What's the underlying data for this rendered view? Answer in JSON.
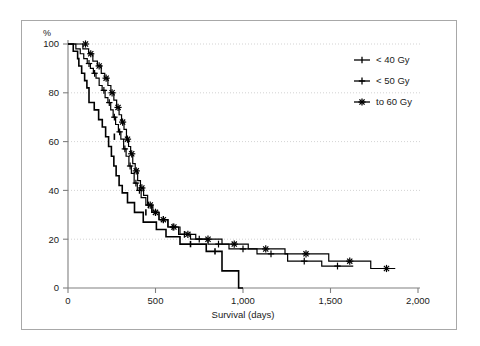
{
  "figure": {
    "background": "#ffffff",
    "frame_color": "#a8a8a8",
    "axis_color": "#808080",
    "grid_color": "#c8c8c8",
    "curve_color": "#000000"
  },
  "chart_data": {
    "type": "line",
    "subtype": "kaplan-meier-step",
    "title": "",
    "xlabel": "Survival (days)",
    "ylabel": "%",
    "xlim": [
      0,
      2000
    ],
    "ylim": [
      0,
      100
    ],
    "xticks": [
      0,
      500,
      1000,
      1500,
      2000
    ],
    "xticklabels": [
      "0",
      "500",
      "1,000",
      "1,500",
      "2,000"
    ],
    "yticks": [
      0,
      20,
      40,
      60,
      80,
      100
    ],
    "yticklabels": [
      "0",
      "20",
      "40",
      "60",
      "80",
      "100"
    ],
    "grid": "horizontal-dotted",
    "legend_position": "upper-right",
    "series": [
      {
        "name": "< 40 Gy",
        "marker": "tick",
        "linewidth": 1.6,
        "points": [
          [
            0,
            100
          ],
          [
            30,
            100
          ],
          [
            30,
            97
          ],
          [
            55,
            97
          ],
          [
            55,
            94
          ],
          [
            62,
            94
          ],
          [
            62,
            91
          ],
          [
            78,
            91
          ],
          [
            78,
            88
          ],
          [
            95,
            88
          ],
          [
            95,
            85
          ],
          [
            108,
            85
          ],
          [
            108,
            82
          ],
          [
            120,
            82
          ],
          [
            120,
            76
          ],
          [
            150,
            76
          ],
          [
            150,
            73
          ],
          [
            175,
            73
          ],
          [
            175,
            69
          ],
          [
            196,
            69
          ],
          [
            196,
            66
          ],
          [
            215,
            66
          ],
          [
            215,
            62
          ],
          [
            232,
            62
          ],
          [
            232,
            58
          ],
          [
            248,
            58
          ],
          [
            248,
            54
          ],
          [
            262,
            54
          ],
          [
            262,
            50
          ],
          [
            275,
            50
          ],
          [
            275,
            46
          ],
          [
            292,
            46
          ],
          [
            292,
            42
          ],
          [
            310,
            42
          ],
          [
            310,
            39
          ],
          [
            340,
            39
          ],
          [
            340,
            35
          ],
          [
            380,
            35
          ],
          [
            380,
            31
          ],
          [
            430,
            31
          ],
          [
            430,
            27
          ],
          [
            505,
            27
          ],
          [
            505,
            24
          ],
          [
            560,
            24
          ],
          [
            560,
            21
          ],
          [
            640,
            21
          ],
          [
            640,
            18
          ],
          [
            790,
            18
          ],
          [
            790,
            15
          ],
          [
            880,
            15
          ],
          [
            880,
            7
          ],
          [
            975,
            7
          ],
          [
            975,
            0
          ],
          [
            1000,
            0
          ]
        ],
        "censored": [
          [
            265,
            62
          ],
          [
            445,
            31
          ],
          [
            700,
            18
          ],
          [
            840,
            15
          ]
        ]
      },
      {
        "name": "< 50 Gy",
        "marker": "plus",
        "linewidth": 1.2,
        "points": [
          [
            0,
            100
          ],
          [
            45,
            100
          ],
          [
            45,
            98
          ],
          [
            70,
            98
          ],
          [
            70,
            96
          ],
          [
            90,
            96
          ],
          [
            90,
            94
          ],
          [
            110,
            94
          ],
          [
            110,
            92
          ],
          [
            128,
            92
          ],
          [
            128,
            90
          ],
          [
            145,
            90
          ],
          [
            145,
            88
          ],
          [
            160,
            88
          ],
          [
            160,
            86
          ],
          [
            178,
            86
          ],
          [
            178,
            83
          ],
          [
            195,
            83
          ],
          [
            195,
            81
          ],
          [
            212,
            81
          ],
          [
            212,
            78
          ],
          [
            228,
            78
          ],
          [
            228,
            76
          ],
          [
            244,
            76
          ],
          [
            244,
            73
          ],
          [
            258,
            73
          ],
          [
            258,
            70
          ],
          [
            272,
            70
          ],
          [
            272,
            67
          ],
          [
            288,
            67
          ],
          [
            288,
            64
          ],
          [
            302,
            64
          ],
          [
            302,
            61
          ],
          [
            318,
            61
          ],
          [
            318,
            57
          ],
          [
            332,
            57
          ],
          [
            332,
            54
          ],
          [
            348,
            54
          ],
          [
            348,
            50
          ],
          [
            362,
            50
          ],
          [
            362,
            47
          ],
          [
            378,
            47
          ],
          [
            378,
            43
          ],
          [
            396,
            43
          ],
          [
            396,
            40
          ],
          [
            418,
            40
          ],
          [
            418,
            37
          ],
          [
            445,
            37
          ],
          [
            445,
            34
          ],
          [
            478,
            34
          ],
          [
            478,
            31
          ],
          [
            520,
            31
          ],
          [
            520,
            28
          ],
          [
            572,
            28
          ],
          [
            572,
            25
          ],
          [
            632,
            25
          ],
          [
            632,
            22
          ],
          [
            700,
            22
          ],
          [
            700,
            20
          ],
          [
            800,
            20
          ],
          [
            800,
            18
          ],
          [
            920,
            18
          ],
          [
            920,
            16
          ],
          [
            1080,
            16
          ],
          [
            1080,
            14
          ],
          [
            1255,
            14
          ],
          [
            1255,
            11
          ],
          [
            1450,
            11
          ],
          [
            1450,
            9
          ],
          [
            1630,
            9
          ]
        ],
        "censored": [
          [
            120,
            92
          ],
          [
            152,
            88
          ],
          [
            205,
            81
          ],
          [
            236,
            76
          ],
          [
            265,
            70
          ],
          [
            295,
            64
          ],
          [
            325,
            57
          ],
          [
            355,
            50
          ],
          [
            388,
            43
          ],
          [
            408,
            40
          ],
          [
            460,
            34
          ],
          [
            500,
            31
          ],
          [
            545,
            28
          ],
          [
            600,
            25
          ],
          [
            665,
            22
          ],
          [
            750,
            20
          ],
          [
            860,
            18
          ],
          [
            1000,
            16
          ],
          [
            1160,
            14
          ],
          [
            1350,
            11
          ],
          [
            1540,
            9
          ]
        ]
      },
      {
        "name": "to 60 Gy",
        "marker": "star",
        "linewidth": 1.2,
        "points": [
          [
            0,
            100
          ],
          [
            85,
            100
          ],
          [
            85,
            98
          ],
          [
            118,
            98
          ],
          [
            118,
            96
          ],
          [
            142,
            96
          ],
          [
            142,
            93
          ],
          [
            168,
            93
          ],
          [
            168,
            91
          ],
          [
            190,
            91
          ],
          [
            190,
            88
          ],
          [
            210,
            88
          ],
          [
            210,
            86
          ],
          [
            228,
            86
          ],
          [
            228,
            83
          ],
          [
            245,
            83
          ],
          [
            245,
            80
          ],
          [
            262,
            80
          ],
          [
            262,
            77
          ],
          [
            278,
            77
          ],
          [
            278,
            74
          ],
          [
            292,
            74
          ],
          [
            292,
            71
          ],
          [
            306,
            71
          ],
          [
            306,
            68
          ],
          [
            320,
            68
          ],
          [
            320,
            65
          ],
          [
            334,
            65
          ],
          [
            334,
            61
          ],
          [
            346,
            61
          ],
          [
            346,
            58
          ],
          [
            358,
            58
          ],
          [
            358,
            55
          ],
          [
            370,
            55
          ],
          [
            370,
            51
          ],
          [
            384,
            51
          ],
          [
            384,
            48
          ],
          [
            398,
            48
          ],
          [
            398,
            44
          ],
          [
            414,
            44
          ],
          [
            414,
            41
          ],
          [
            432,
            41
          ],
          [
            432,
            38
          ],
          [
            455,
            38
          ],
          [
            455,
            34
          ],
          [
            485,
            34
          ],
          [
            485,
            31
          ],
          [
            520,
            31
          ],
          [
            520,
            28
          ],
          [
            570,
            28
          ],
          [
            570,
            25
          ],
          [
            640,
            25
          ],
          [
            640,
            22
          ],
          [
            730,
            22
          ],
          [
            730,
            20
          ],
          [
            880,
            20
          ],
          [
            880,
            18
          ],
          [
            1030,
            18
          ],
          [
            1030,
            16
          ],
          [
            1240,
            16
          ],
          [
            1240,
            14
          ],
          [
            1490,
            14
          ],
          [
            1490,
            11
          ],
          [
            1730,
            11
          ],
          [
            1730,
            8
          ],
          [
            1870,
            8
          ]
        ],
        "censored": [
          [
            100,
            100
          ],
          [
            130,
            96
          ],
          [
            178,
            91
          ],
          [
            218,
            86
          ],
          [
            252,
            80
          ],
          [
            286,
            74
          ],
          [
            312,
            68
          ],
          [
            340,
            61
          ],
          [
            364,
            55
          ],
          [
            390,
            48
          ],
          [
            422,
            41
          ],
          [
            470,
            34
          ],
          [
            500,
            31
          ],
          [
            545,
            28
          ],
          [
            605,
            25
          ],
          [
            685,
            22
          ],
          [
            800,
            20
          ],
          [
            950,
            18
          ],
          [
            1130,
            16
          ],
          [
            1360,
            14
          ],
          [
            1610,
            11
          ],
          [
            1820,
            8
          ]
        ]
      }
    ]
  },
  "legend": {
    "items": [
      {
        "label": "< 40 Gy",
        "marker": "tick"
      },
      {
        "label": "< 50 Gy",
        "marker": "plus"
      },
      {
        "label": "to 60 Gy",
        "marker": "star"
      }
    ]
  }
}
